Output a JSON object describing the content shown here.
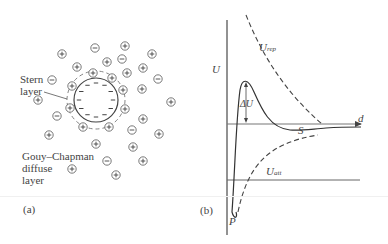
{
  "panel_a": {
    "label": "(a)",
    "stern_label_line1": "Stern",
    "stern_label_line2": "layer",
    "gouy_line1": "Gouy–Chapman",
    "gouy_line2": "diffuse",
    "gouy_line3": "layer",
    "particle": {
      "cx": 96,
      "cy": 100,
      "r": 22,
      "stern_r": 29,
      "surface_charges": 12
    },
    "stern_ions": [
      {
        "x": 93,
        "y": 73,
        "s": "+"
      },
      {
        "x": 112,
        "y": 78,
        "s": "+"
      },
      {
        "x": 72,
        "y": 86,
        "s": "+"
      },
      {
        "x": 123,
        "y": 90,
        "s": "+"
      },
      {
        "x": 70,
        "y": 108,
        "s": "+"
      },
      {
        "x": 125,
        "y": 109,
        "s": "+"
      },
      {
        "x": 83,
        "y": 127,
        "s": "+"
      },
      {
        "x": 109,
        "y": 127,
        "s": "+"
      }
    ],
    "diffuse_ions": [
      {
        "x": 62,
        "y": 54,
        "s": "+"
      },
      {
        "x": 95,
        "y": 48,
        "s": "−"
      },
      {
        "x": 125,
        "y": 46,
        "s": "+"
      },
      {
        "x": 107,
        "y": 62,
        "s": "+"
      },
      {
        "x": 122,
        "y": 59,
        "s": "−"
      },
      {
        "x": 152,
        "y": 54,
        "s": "+"
      },
      {
        "x": 77,
        "y": 67,
        "s": "+"
      },
      {
        "x": 143,
        "y": 68,
        "s": "+"
      },
      {
        "x": 127,
        "y": 73,
        "s": "+"
      },
      {
        "x": 158,
        "y": 79,
        "s": "−"
      },
      {
        "x": 52,
        "y": 80,
        "s": "−"
      },
      {
        "x": 38,
        "y": 100,
        "s": "+"
      },
      {
        "x": 142,
        "y": 89,
        "s": "+"
      },
      {
        "x": 171,
        "y": 102,
        "s": "+"
      },
      {
        "x": 57,
        "y": 116,
        "s": "−"
      },
      {
        "x": 143,
        "y": 119,
        "s": "+"
      },
      {
        "x": 132,
        "y": 130,
        "s": "−"
      },
      {
        "x": 49,
        "y": 135,
        "s": "+"
      },
      {
        "x": 159,
        "y": 134,
        "s": "+"
      },
      {
        "x": 96,
        "y": 144,
        "s": "+"
      },
      {
        "x": 133,
        "y": 147,
        "s": "+"
      },
      {
        "x": 107,
        "y": 161,
        "s": "−"
      },
      {
        "x": 143,
        "y": 161,
        "s": "+"
      },
      {
        "x": 72,
        "y": 169,
        "s": "+"
      },
      {
        "x": 116,
        "y": 175,
        "s": "+"
      }
    ]
  },
  "panel_b": {
    "label": "(b)",
    "y_axis_label": "U",
    "x_axis_label": "d",
    "delta_u_label": "ΔU",
    "secondary_min_label": "S",
    "primary_min_label": "P",
    "repulsion_label": "U",
    "repulsion_sub": "rep",
    "attraction_label": "U",
    "attraction_sub": "att"
  },
  "chart_data": {
    "type": "line",
    "title": "",
    "xlabel": "d",
    "ylabel": "U",
    "series": [
      {
        "name": "U_rep",
        "style": "dashed",
        "description": "repulsive potential, decays from large positive to zero with distance"
      },
      {
        "name": "U_att",
        "style": "dashed",
        "description": "attractive potential, rises from large negative to zero with distance"
      },
      {
        "name": "U_total",
        "style": "solid",
        "description": "net potential with deep primary minimum P near d=0, energy barrier of height ΔU, and shallow secondary minimum S"
      }
    ],
    "annotations": [
      "ΔU",
      "S",
      "P",
      "U_rep",
      "U_att"
    ],
    "grid": false
  }
}
